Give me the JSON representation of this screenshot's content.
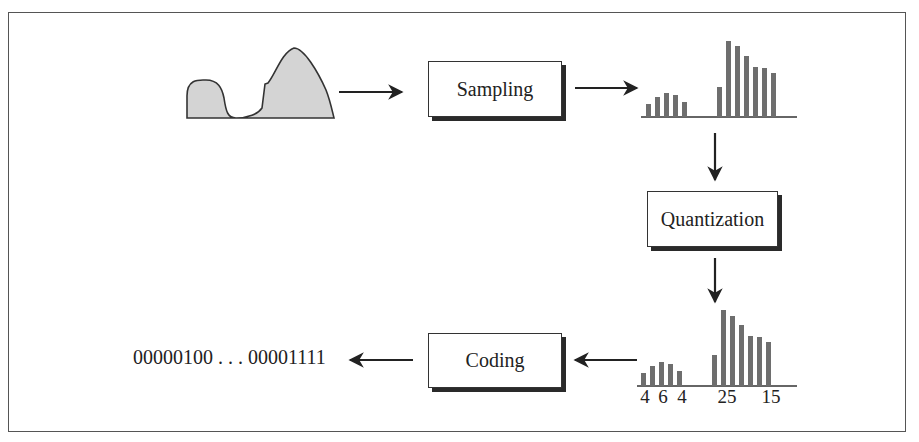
{
  "diagram": {
    "stages": [
      {
        "id": "sampling",
        "label": "Sampling"
      },
      {
        "id": "quantization",
        "label": "Quantization"
      },
      {
        "id": "coding",
        "label": "Coding"
      }
    ],
    "input": {
      "label": "analog-signal-waveform"
    },
    "output": {
      "label": "00000100 . . . 00001111"
    },
    "quantized_labels": [
      "4",
      "6",
      "4",
      "25",
      "15"
    ],
    "colors": {
      "bar": "#6e6e6e",
      "signal_fill": "#d4d4d4",
      "stroke": "#222222",
      "shadow": "#2a2a2a"
    },
    "sampled_bars": {
      "left_group_heights": [
        13,
        20,
        24,
        22,
        15
      ],
      "right_group_heights": [
        30,
        76,
        71,
        61,
        50,
        49,
        44
      ]
    },
    "quantized_bars": {
      "left_group_heights": [
        13,
        20,
        24,
        22,
        15
      ],
      "right_group_heights": [
        31,
        76,
        70,
        61,
        50,
        49,
        44
      ]
    },
    "arrows": [
      {
        "from": "analog-signal",
        "to": "sampling"
      },
      {
        "from": "sampling",
        "to": "sampled-histogram"
      },
      {
        "from": "sampled-histogram",
        "to": "quantization"
      },
      {
        "from": "quantization",
        "to": "quantized-histogram"
      },
      {
        "from": "quantized-histogram",
        "to": "coding"
      },
      {
        "from": "coding",
        "to": "binary-output"
      }
    ]
  }
}
